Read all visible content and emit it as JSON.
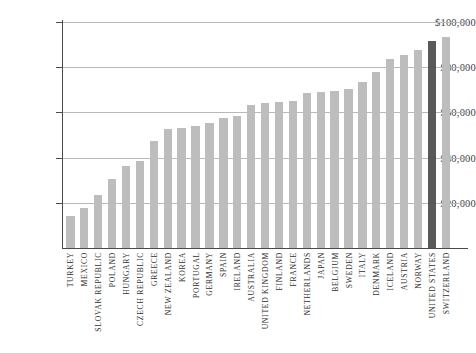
{
  "chart_data": {
    "type": "bar",
    "title": "",
    "subtitle": "",
    "xlabel": "",
    "ylabel": "",
    "ylim": [
      0,
      100000
    ],
    "grid": true,
    "legend": false,
    "orientation": "vertical",
    "highlight_category": "UNITED STATES",
    "colors": {
      "bar": "#bdbdbd",
      "bar_highlight": "#595959",
      "gridline": "#b9b9b9",
      "axis": "#4a4a4a",
      "text": "#2e2e2e",
      "background": "#ffffff"
    },
    "y_ticks": [
      {
        "value": 20000,
        "label": "$20,000"
      },
      {
        "value": 40000,
        "label": "$40,000"
      },
      {
        "value": 60000,
        "label": "$60,000"
      },
      {
        "value": 80000,
        "label": "$80,000"
      },
      {
        "value": 100000,
        "label": "$100,000"
      }
    ],
    "categories": [
      "TURKEY",
      "MEXICO",
      "SLOVAK REPUBLIC",
      "POLAND",
      "HUNGARY",
      "CZECH REPUBLIC",
      "GREECE",
      "NEW ZEALAND",
      "KOREA",
      "PORTUGAL",
      "GERMANY",
      "SPAIN",
      "IRELAND",
      "AUSTRALIA",
      "UNITED KINGDOM",
      "FINLAND",
      "FRANCE",
      "NETHERLANDS",
      "JAPAN",
      "BELGIUM",
      "SWEDEN",
      "ITALY",
      "DENMARK",
      "ICELAND",
      "AUSTRIA",
      "NORWAY",
      "UNITED STATES",
      "SWITZERLAND"
    ],
    "values": [
      14000,
      17500,
      23500,
      30500,
      36500,
      38500,
      47500,
      52500,
      53000,
      54000,
      55500,
      57500,
      58500,
      63500,
      64000,
      64500,
      65000,
      68500,
      69000,
      69500,
      70500,
      73500,
      78000,
      83500,
      85500,
      87500,
      91500,
      93500
    ]
  }
}
